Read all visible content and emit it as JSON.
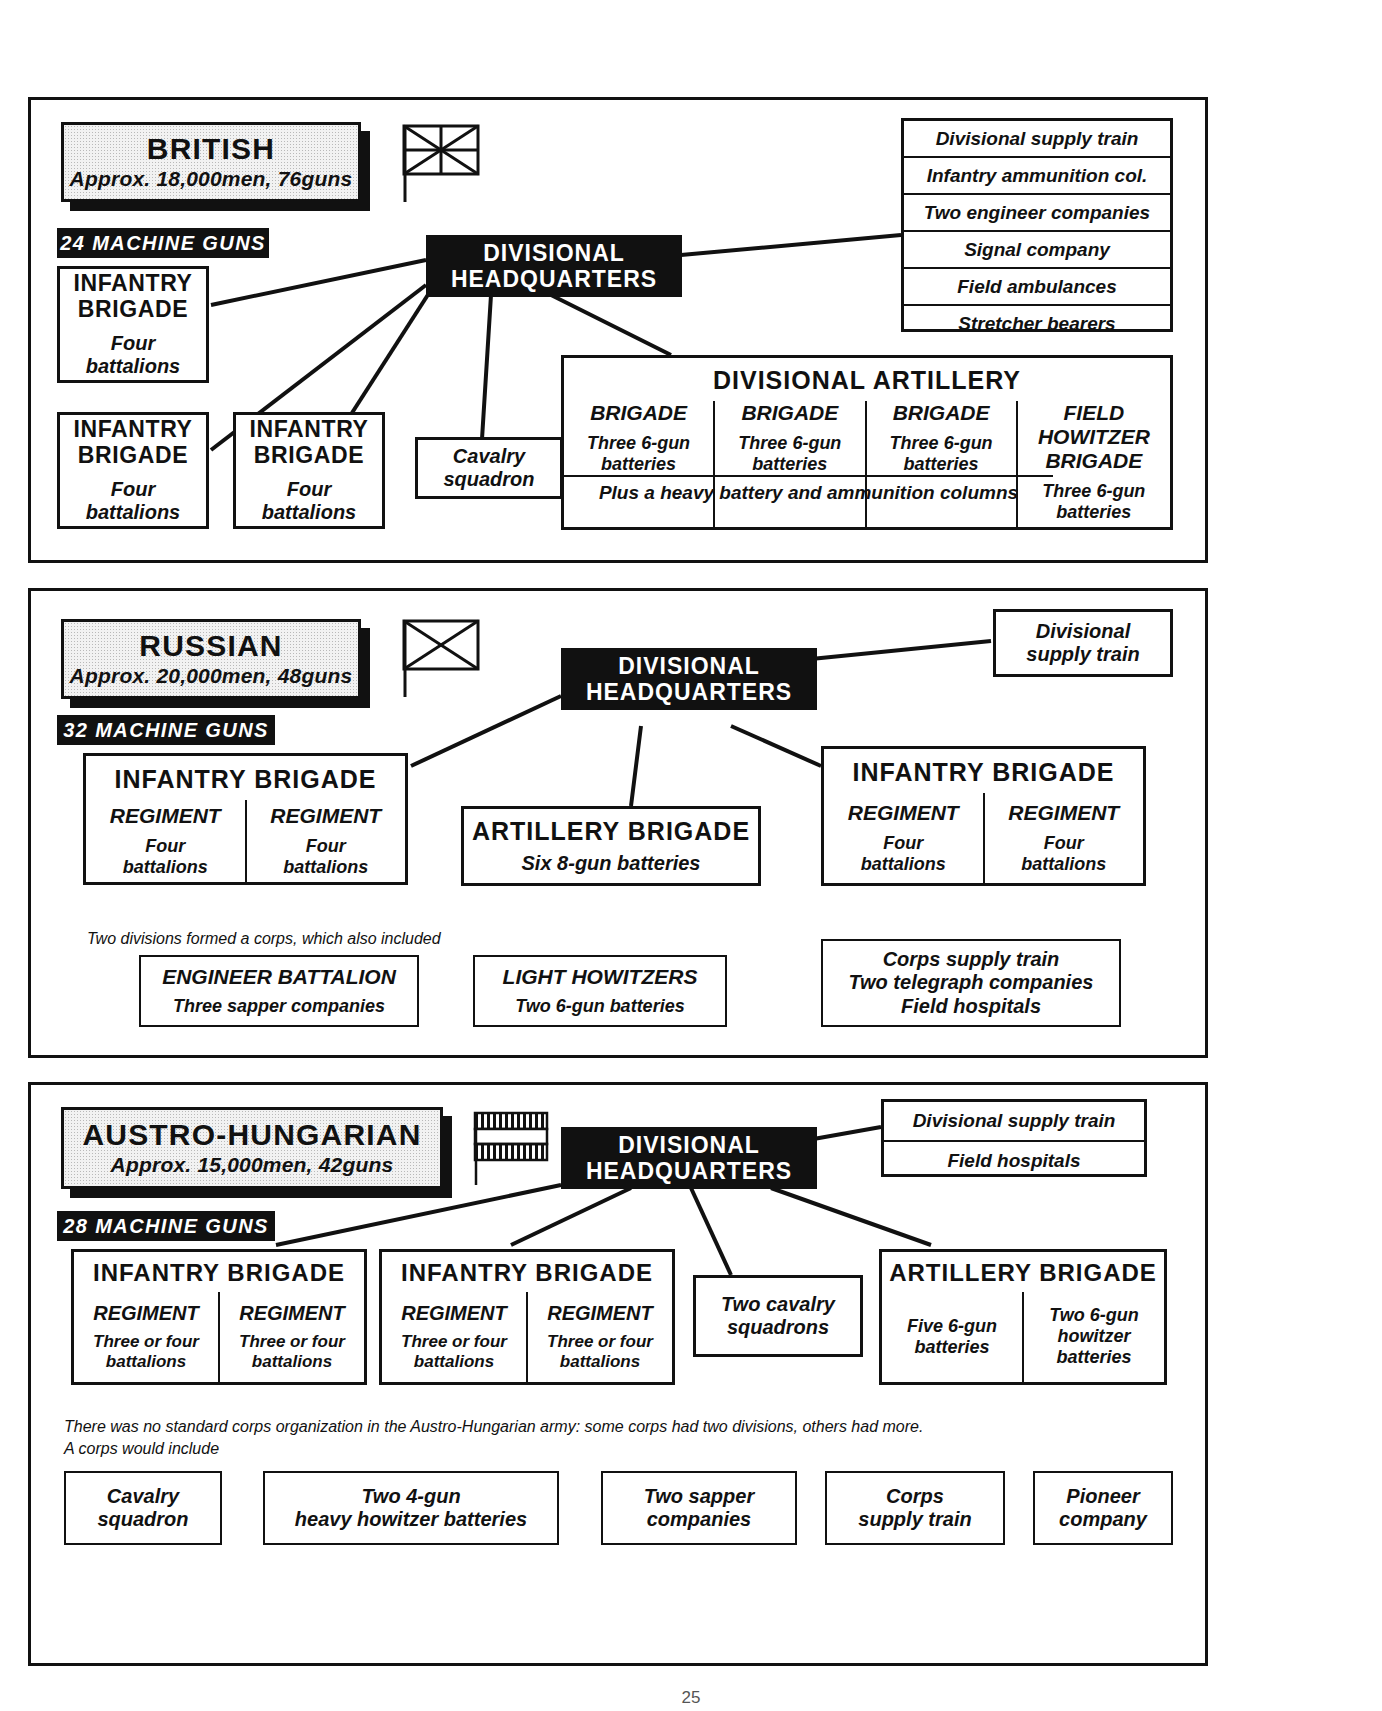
{
  "page": {
    "number": "25"
  },
  "sections": [
    {
      "id": "british",
      "nation": "BRITISH",
      "strength": "Approx. 18,000men, 76guns",
      "machine_guns": "24 MACHINE GUNS",
      "flag": "union-jack-flag-icon",
      "hq": "DIVISIONAL\nHEADQUARTERS",
      "hq_line1": "DIVISIONAL",
      "hq_line2": "HEADQUARTERS",
      "brigades": [
        {
          "title": "INFANTRY\nBRIGADE",
          "title1": "INFANTRY",
          "title2": "BRIGADE",
          "sub": "Four\nbattalions",
          "sub1": "Four",
          "sub2": "battalions"
        },
        {
          "title1": "INFANTRY",
          "title2": "BRIGADE",
          "sub1": "Four",
          "sub2": "battalions"
        },
        {
          "title1": "INFANTRY",
          "title2": "BRIGADE",
          "sub1": "Four",
          "sub2": "battalions"
        }
      ],
      "cavalry1": "Cavalry",
      "cavalry2": "squadron",
      "services": [
        "Divisional supply train",
        "Infantry ammunition col.",
        "Two engineer companies",
        "Signal company",
        "Field ambulances",
        "Stretcher bearers"
      ],
      "artillery": {
        "title": "DIVISIONAL  ARTILLERY",
        "columns": [
          {
            "head": "BRIGADE",
            "body1": "Three 6-gun",
            "body2": "batteries"
          },
          {
            "head": "BRIGADE",
            "body1": "Three 6-gun",
            "body2": "batteries"
          },
          {
            "head": "BRIGADE",
            "body1": "Three 6-gun",
            "body2": "batteries"
          },
          {
            "head1": "FIELD",
            "head2": "HOWITZER",
            "head3": "BRIGADE",
            "body1": "Three 6-gun",
            "body2": "batteries"
          }
        ],
        "footer": "Plus a heavy battery and ammunition columns"
      }
    },
    {
      "id": "russian",
      "nation": "RUSSIAN",
      "strength": "Approx. 20,000men, 48guns",
      "machine_guns": "32 MACHINE GUNS",
      "flag": "saltire-cross-flag-icon",
      "hq_line1": "DIVISIONAL",
      "hq_line2": "HEADQUARTERS",
      "supply1": "Divisional",
      "supply2": "supply train",
      "brigade_left": {
        "title": "INFANTRY  BRIGADE",
        "regiments": [
          {
            "head": "REGIMENT",
            "body1": "Four",
            "body2": "battalions"
          },
          {
            "head": "REGIMENT",
            "body1": "Four",
            "body2": "battalions"
          }
        ]
      },
      "brigade_right": {
        "title": "INFANTRY  BRIGADE",
        "regiments": [
          {
            "head": "REGIMENT",
            "body1": "Four",
            "body2": "battalions"
          },
          {
            "head": "REGIMENT",
            "body1": "Four",
            "body2": "battalions"
          }
        ]
      },
      "artillery": {
        "title": "ARTILLERY  BRIGADE",
        "body": "Six 8-gun batteries"
      },
      "corps_note": "Two divisions formed a corps, which also included",
      "corps_boxes": [
        {
          "head": "ENGINEER  BATTALION",
          "body": "Three sapper companies"
        },
        {
          "head": "LIGHT HOWITZERS",
          "body": "Two 6-gun batteries"
        }
      ],
      "corps_services": [
        "Corps supply train",
        "Two telegraph companies",
        "Field hospitals"
      ]
    },
    {
      "id": "austro",
      "nation": "AUSTRO-HUNGARIAN",
      "strength": "Approx. 15,000men, 42guns",
      "machine_guns": "28 MACHINE GUNS",
      "flag": "striped-bands-flag-icon",
      "hq_line1": "DIVISIONAL",
      "hq_line2": "HEADQUARTERS",
      "services": [
        "Divisional supply train",
        "Field hospitals"
      ],
      "brigades": [
        {
          "title": "INFANTRY  BRIGADE",
          "regiments": [
            {
              "head": "REGIMENT",
              "body1": "Three or four",
              "body2": "battalions"
            },
            {
              "head": "REGIMENT",
              "body1": "Three or four",
              "body2": "battalions"
            }
          ]
        },
        {
          "title": "INFANTRY  BRIGADE",
          "regiments": [
            {
              "head": "REGIMENT",
              "body1": "Three or four",
              "body2": "battalions"
            },
            {
              "head": "REGIMENT",
              "body1": "Three or four",
              "body2": "battalions"
            }
          ]
        }
      ],
      "cavalry1": "Two cavalry",
      "cavalry2": "squadrons",
      "artillery": {
        "title": "ARTILLERY  BRIGADE",
        "columns": [
          {
            "body1": "Five 6-gun",
            "body2": "batteries",
            "body3": ""
          },
          {
            "body1": "Two 6-gun",
            "body2": "howitzer",
            "body3": "batteries"
          }
        ]
      },
      "corps_note_line1": "There was no standard corps organization in the Austro-Hungarian army: some corps had two divisions, others had more.",
      "corps_note_line2": "A corps would include",
      "corps_boxes": [
        {
          "line1": "Cavalry",
          "line2": "squadron"
        },
        {
          "line1": "Two 4-gun",
          "line2": "heavy howitzer batteries"
        },
        {
          "line1": "Two sapper",
          "line2": "companies"
        },
        {
          "line1": "Corps",
          "line2": "supply train"
        },
        {
          "line1": "Pioneer",
          "line2": "company"
        }
      ]
    }
  ],
  "colors": {
    "ink": "#111111",
    "paper": "#ffffff",
    "plaque": "#f2f2f2"
  }
}
